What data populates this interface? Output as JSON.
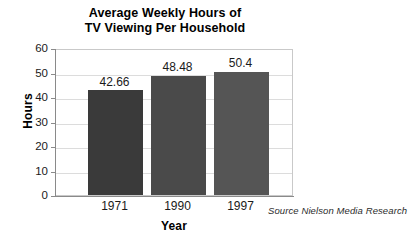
{
  "chart_data": {
    "type": "bar",
    "title": "Average Weekly Hours of TV Viewing Per Household",
    "title_line1": "Average Weekly Hours of",
    "title_line2": "TV Viewing Per Household",
    "xlabel": "Year",
    "ylabel": "Hours",
    "categories": [
      "1971",
      "1990",
      "1997"
    ],
    "values": [
      42.66,
      48.48,
      50.4
    ],
    "value_labels": [
      "42.66",
      "48.48",
      "50.4"
    ],
    "ylim": [
      0,
      60
    ],
    "ytick_labels": [
      "0",
      "10",
      "20",
      "30",
      "40",
      "50",
      "60"
    ],
    "ytick_values": [
      0,
      10,
      20,
      30,
      40,
      50,
      60
    ],
    "grid": true,
    "grid_axis": "y",
    "legend": false,
    "annotations": [
      "Source Nielson Media Research"
    ],
    "source": "Source Nielson Media Research",
    "bar_colors": [
      "#3a3a3a",
      "#4a4a4a",
      "#555555"
    ],
    "colors": {
      "background": "#ffffff",
      "gridline": "#dcdcdc",
      "axis": "#8a8a8a",
      "text": "#1a1a1a",
      "title": "#000000"
    }
  }
}
